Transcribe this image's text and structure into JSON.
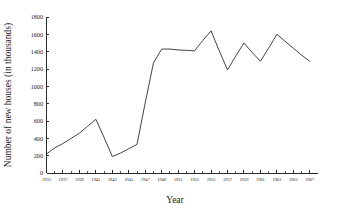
{
  "chart_data": {
    "type": "line",
    "title": "",
    "xlabel": "Year",
    "ylabel": "Number of new houses (in thousands)",
    "xlim": [
      1935,
      1968
    ],
    "ylim": [
      0,
      1800
    ],
    "grid": false,
    "legend": false,
    "legend_position": "none",
    "line_color": "#444444",
    "axis_color": "#2b2b2b",
    "background_color": "#ffffff",
    "ytick_labels": [
      "0",
      "200",
      "400",
      "600",
      "800",
      "1000",
      "1200",
      "1400",
      "1600",
      "1800"
    ],
    "ytick_values": [
      0,
      200,
      400,
      600,
      800,
      1000,
      1200,
      1400,
      1600,
      1800
    ],
    "xtick_labels": [
      "1935",
      "1937",
      "1939",
      "1941",
      "1943",
      "1945",
      "1947",
      "1949",
      "1951",
      "1953",
      "1955",
      "1957",
      "1959",
      "1961",
      "1963",
      "1965",
      "1967"
    ],
    "xtick_values": [
      1935,
      1937,
      1939,
      1941,
      1943,
      1945,
      1947,
      1949,
      1951,
      1953,
      1955,
      1957,
      1959,
      1961,
      1963,
      1965,
      1967
    ],
    "x": [
      1935,
      1936,
      1937,
      1938,
      1939,
      1940,
      1941,
      1942,
      1943,
      1944,
      1945,
      1946,
      1947,
      1948,
      1949,
      1950,
      1951,
      1952,
      1953,
      1954,
      1955,
      1956,
      1957,
      1958,
      1959,
      1960,
      1961,
      1962,
      1963,
      1964,
      1965,
      1966,
      1967
    ],
    "values": [
      220,
      290,
      340,
      400,
      460,
      540,
      620,
      410,
      190,
      230,
      280,
      330,
      810,
      1270,
      1430,
      1430,
      1420,
      1415,
      1410,
      1530,
      1640,
      1410,
      1190,
      1350,
      1500,
      1390,
      1290,
      1440,
      1600,
      1520,
      1440,
      1360,
      1290
    ],
    "series": [
      {
        "name": "New houses",
        "values": [
          220,
          290,
          340,
          400,
          460,
          540,
          620,
          410,
          190,
          230,
          280,
          330,
          810,
          1270,
          1430,
          1430,
          1420,
          1415,
          1410,
          1530,
          1640,
          1410,
          1190,
          1350,
          1500,
          1390,
          1290,
          1440,
          1600,
          1520,
          1440,
          1360,
          1290
        ]
      }
    ],
    "annotations": []
  }
}
